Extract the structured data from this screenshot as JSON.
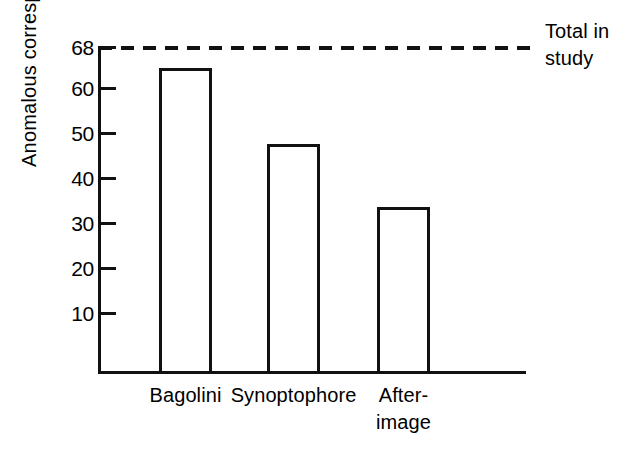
{
  "chart_data": {
    "type": "bar",
    "title": "",
    "xlabel": "",
    "ylabel": "Anomalous correspondence",
    "categories": [
      "Bagolini",
      "Synoptophore",
      "After-image"
    ],
    "values": [
      64,
      48,
      34
    ],
    "ylim": [
      0,
      68
    ],
    "yticks": [
      10,
      20,
      30,
      40,
      50,
      60,
      68
    ],
    "ytick_labels": [
      "10",
      "20",
      "30",
      "40",
      "50",
      "60",
      "68"
    ],
    "grid": false,
    "legend": "none",
    "annotations": [
      {
        "name": "total-in-study-reference-line",
        "value": 68,
        "style": "dashed",
        "label_line1": "Total in",
        "label_line2": "study"
      }
    ],
    "colors": {
      "ink": "#111111",
      "background": "#ffffff",
      "bar_fill": "#ffffff",
      "bar_stroke": "#111111"
    }
  },
  "axis": {
    "y_title": "Anomalous correspondence"
  },
  "ticks": [
    {
      "label": "68",
      "value": 68,
      "top": 46
    },
    {
      "label": "60",
      "value": 60,
      "top": 87
    },
    {
      "label": "50",
      "value": 50,
      "top": 132
    },
    {
      "label": "40",
      "value": 40,
      "top": 177
    },
    {
      "label": "30",
      "value": 30,
      "top": 222
    },
    {
      "label": "20",
      "value": 20,
      "top": 267
    },
    {
      "label": "10",
      "value": 10,
      "top": 312
    }
  ],
  "bars": [
    {
      "label": "Bagolini",
      "value": 64,
      "left": 159,
      "width": 53,
      "top": 68,
      "height": 306,
      "label_line1": "Bagolini",
      "label_line2": ""
    },
    {
      "label": "Synoptophore",
      "value": 48,
      "left": 267,
      "width": 53,
      "top": 144,
      "height": 230,
      "label_line1": "Synoptophore",
      "label_line2": ""
    },
    {
      "label": "After-image",
      "value": 34,
      "left": 377,
      "width": 53,
      "top": 207,
      "height": 167,
      "label_line1": "After-",
      "label_line2": "image"
    }
  ],
  "reference": {
    "label_line1": "Total in",
    "label_line2": "study"
  }
}
